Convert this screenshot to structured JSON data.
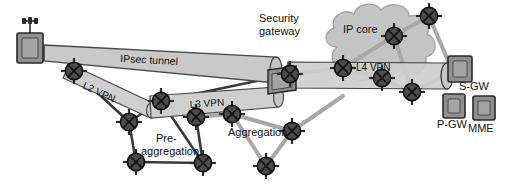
{
  "figure": {
    "type": "network-diagram",
    "width": 506,
    "height": 193
  },
  "colors": {
    "background": "#ffffff",
    "tunnel_fill": "#c9c9c9",
    "tunnel_fill_light": "#d5d5d5",
    "tunnel_stroke": "#4a4a4a",
    "cloud_fill": "#bdbdbd",
    "cloud_stroke": "#9a9a9a",
    "node_fill": "#4c4c4c",
    "node_stroke": "#111111",
    "link_dark": "#3a3a3a",
    "link_light": "#a8a8a8",
    "box_fill": "#8f8f8f",
    "box_stroke": "#2b2b2b",
    "label_text": "#111111",
    "tunnel_label_text": "#f2f2f2"
  },
  "labels": {
    "ipsec_tunnel": "IPsec tunnel",
    "l2_vpn": "L2 VPN",
    "l3_vpn": "L3 VPN",
    "l4_vpn": "L4 VPN",
    "security_gateway_line1": "Security",
    "security_gateway_line2": "gateway",
    "ip_core": "IP core",
    "pre_aggregation_line1": "Pre-",
    "pre_aggregation_line2": "aggregation",
    "aggregation": "Aggregation",
    "sgw": "S-GW",
    "pgw": "P-GW",
    "mme": "MME"
  },
  "elements": {
    "base_station": {
      "name": "eNodeB base station",
      "x": 30,
      "y": 36
    },
    "security_gateway_icon": {
      "name": "Security gateway appliance",
      "x": 291,
      "y": 76
    },
    "sgw_icon": {
      "name": "Serving Gateway",
      "x": 460,
      "y": 67
    },
    "pgw_icon": {
      "name": "Packet Data Network Gateway",
      "x": 454,
      "y": 105
    },
    "mme_icon": {
      "name": "Mobility Management Entity",
      "x": 483,
      "y": 107
    },
    "ip_core_cloud": {
      "name": "IP core cloud",
      "cx": 383,
      "cy": 50
    }
  },
  "tunnels": [
    {
      "id": "ipsec",
      "label": "IPsec tunnel",
      "from": "base-station",
      "to": "security-gateway"
    },
    {
      "id": "l2vpn",
      "label": "L2 VPN",
      "from": "access-node",
      "to": "pre-aggregation-node"
    },
    {
      "id": "l3vpn",
      "label": "L3 VPN",
      "from": "pre-aggregation-node",
      "to": "security-gateway"
    },
    {
      "id": "l4vpn",
      "label": "L4 VPN",
      "from": "security-gateway",
      "to": "s-gw"
    }
  ],
  "nodes": [
    {
      "id": "n1",
      "name": "access-router",
      "x": 74,
      "y": 71
    },
    {
      "id": "n2",
      "name": "pre-agg-router-a",
      "x": 161,
      "y": 101
    },
    {
      "id": "n3",
      "name": "pre-agg-router-b",
      "x": 129,
      "y": 122
    },
    {
      "id": "n4",
      "name": "pre-agg-router-c",
      "x": 136,
      "y": 162
    },
    {
      "id": "n5",
      "name": "pre-agg-router-d",
      "x": 203,
      "y": 163
    },
    {
      "id": "n6",
      "name": "agg-router-a",
      "x": 196,
      "y": 117
    },
    {
      "id": "n7",
      "name": "agg-router-b",
      "x": 232,
      "y": 114
    },
    {
      "id": "n8",
      "name": "agg-router-c",
      "x": 266,
      "y": 166
    },
    {
      "id": "n9",
      "name": "agg-router-d",
      "x": 292,
      "y": 131
    },
    {
      "id": "n10",
      "name": "security-gw-router",
      "x": 290,
      "y": 74
    },
    {
      "id": "n11",
      "name": "core-edge-router",
      "x": 343,
      "y": 68
    },
    {
      "id": "n12",
      "name": "core-router-a",
      "x": 394,
      "y": 36
    },
    {
      "id": "n13",
      "name": "core-router-b",
      "x": 429,
      "y": 16
    },
    {
      "id": "n14",
      "name": "core-router-c",
      "x": 382,
      "y": 78
    },
    {
      "id": "n15",
      "name": "core-router-d",
      "x": 412,
      "y": 92
    }
  ]
}
